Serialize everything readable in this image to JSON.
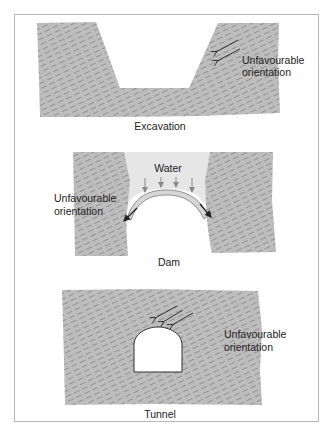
{
  "figure": {
    "panels": [
      {
        "id": "excavation",
        "caption": "Excavation",
        "annotation_line1": "Unfavourable",
        "annotation_line2": "orientation"
      },
      {
        "id": "dam",
        "caption": "Dam",
        "water_label": "Water",
        "annotation_line1": "Unfavourable",
        "annotation_line2": "orientation"
      },
      {
        "id": "tunnel",
        "caption": "Tunnel",
        "annotation_line1": "Unfavourable",
        "annotation_line2": "orientation"
      }
    ],
    "colors": {
      "rock": "#bdbdbd",
      "hatch": "#8f8f8f",
      "water": "#e6e6e6",
      "frame": "#b8b8b8",
      "arrow_dark": "#222222",
      "arrow_grey": "#888888"
    }
  }
}
